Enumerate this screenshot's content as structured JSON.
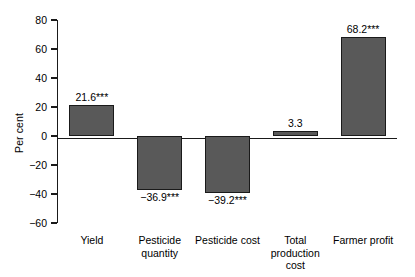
{
  "chart_data": {
    "type": "bar",
    "title": "",
    "xlabel": "",
    "ylabel": "Per cent",
    "ylim": [
      -60,
      80
    ],
    "yticks": [
      80,
      60,
      40,
      20,
      0,
      -20,
      -40,
      -60
    ],
    "ytick_labels": [
      "80",
      "60",
      "40",
      "20",
      "0",
      "−20",
      "−40",
      "−60"
    ],
    "grid": false,
    "legend": null,
    "bar_color": "#595959",
    "bar_edge_color": "#1a1a1a",
    "categories": [
      "Yield",
      "Pesticide\nquantity",
      "Pesticide cost",
      "Total\nproduction\ncost",
      "Farmer profit"
    ],
    "values": [
      21.6,
      -36.9,
      -39.2,
      3.3,
      68.2
    ],
    "data_labels": [
      "21.6***",
      "−36.9***",
      "−39.2***",
      "3.3",
      "68.2***"
    ],
    "significance_note": "*** denotes statistical significance"
  }
}
